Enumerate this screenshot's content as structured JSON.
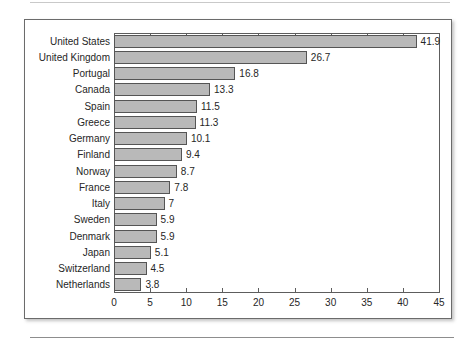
{
  "chart_data": {
    "type": "bar",
    "orientation": "horizontal",
    "title": "",
    "subtitle": "",
    "xlabel": "",
    "ylabel": "",
    "categories": [
      "United States",
      "United Kingdom",
      "Portugal",
      "Canada",
      "Spain",
      "Greece",
      "Germany",
      "Finland",
      "Norway",
      "France",
      "Italy",
      "Sweden",
      "Denmark",
      "Japan",
      "Switzerland",
      "Netherlands"
    ],
    "values": [
      41.9,
      26.7,
      16.8,
      13.3,
      11.5,
      11.3,
      10.1,
      9.4,
      8.7,
      7.8,
      7,
      5.9,
      5.9,
      5.1,
      4.5,
      3.8
    ],
    "data_labels": [
      "41.9",
      "26.7",
      "16.8",
      "13.3",
      "11.5",
      "11.3",
      "10.1",
      "9.4",
      "8.7",
      "7.8",
      "7",
      "5.9",
      "5.9",
      "5.1",
      "4.5",
      "3.8"
    ],
    "xlim": [
      0,
      45
    ],
    "xticks": [
      0,
      5,
      10,
      15,
      20,
      25,
      30,
      35,
      40,
      45
    ],
    "xtick_labels": [
      "0",
      "5",
      "10",
      "15",
      "20",
      "25",
      "30",
      "35",
      "40",
      "45"
    ],
    "grid": false,
    "legend": null,
    "bar_color": "#b9b9b9",
    "bar_border_color": "#555555",
    "axis_color": "#5d5d5d",
    "text_color": "#262626",
    "ticks_on_top_axis": true,
    "ticks_on_bottom_axis": true
  }
}
